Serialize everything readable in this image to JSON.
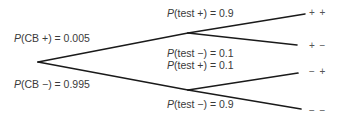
{
  "diagram": {
    "type": "probability-tree",
    "root_branches": [
      {
        "label_prefix": "P",
        "label_rest": "(CB +) = 0.005"
      },
      {
        "label_prefix": "P",
        "label_rest": "(CB −) = 0.995"
      }
    ],
    "upper_branches": [
      {
        "label_prefix": "P",
        "label_rest": "(test +) = 0.9"
      },
      {
        "label_prefix": "P",
        "label_rest": "(test −) = 0.1"
      }
    ],
    "lower_branches": [
      {
        "label_prefix": "P",
        "label_rest": "(test +) = 0.1"
      },
      {
        "label_prefix": "P",
        "label_rest": "(test −) = 0.9"
      }
    ],
    "outcomes": [
      "+ +",
      "+ −",
      "− +",
      "− −"
    ],
    "line_color": "#1a1a1a"
  }
}
